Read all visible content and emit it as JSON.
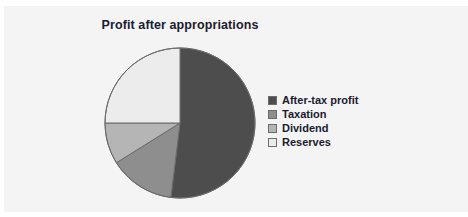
{
  "chart_data": {
    "type": "pie",
    "title": "Profit after appropriations",
    "xlabel": "",
    "ylabel": "",
    "legend_position": "right",
    "grid": false,
    "categories": [
      "After-tax profit",
      "Taxation",
      "Dividend",
      "Reserves"
    ],
    "values": [
      52,
      14,
      9,
      25
    ],
    "units": "percent",
    "slices": [
      {
        "label": "After-tax profit",
        "value": 52,
        "color": "#4d4d4d",
        "start_angle_deg": 0,
        "end_angle_deg": 187
      },
      {
        "label": "Taxation",
        "value": 14,
        "color": "#8e8e8e",
        "start_angle_deg": 187,
        "end_angle_deg": 238
      },
      {
        "label": "Dividend",
        "value": 9,
        "color": "#b5b5b5",
        "start_angle_deg": 238,
        "end_angle_deg": 270
      },
      {
        "label": "Reserves",
        "value": 25,
        "color": "#ececec",
        "start_angle_deg": 270,
        "end_angle_deg": 360
      }
    ]
  },
  "chart": {
    "title": "Profit after appropriations",
    "background_color": "#f4f4f4",
    "outline_color": "#6b6b6b",
    "title_color": "#1b1b2f",
    "center_x": 180,
    "center_y": 123,
    "radius": 75
  },
  "legend": {
    "items": [
      {
        "label": "After-tax profit",
        "color": "#4d4d4d"
      },
      {
        "label": "Taxation",
        "color": "#8e8e8e"
      },
      {
        "label": "Dividend",
        "color": "#b5b5b5"
      },
      {
        "label": "Reserves",
        "color": "#ececec"
      }
    ]
  }
}
